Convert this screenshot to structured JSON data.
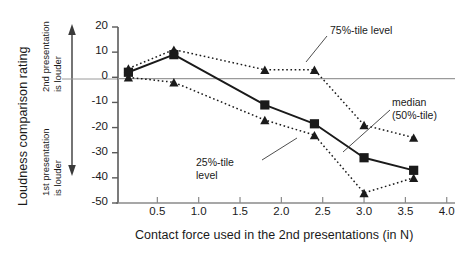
{
  "chart_data": {
    "type": "line",
    "title": "",
    "xlabel": "Contact force used in the 2nd presentations (in N)",
    "ylabel": "Loudness comparison rating",
    "xlim": [
      0.0,
      4.1
    ],
    "ylim": [
      -50,
      20
    ],
    "xticks": [
      "0.5",
      "1.0",
      "1.5",
      "2.0",
      "2.5",
      "3.0",
      "3.5",
      "4.0"
    ],
    "xtick_values": [
      0.5,
      1.0,
      1.5,
      2.0,
      2.5,
      3.0,
      3.5,
      4.0
    ],
    "yticks": [
      "20",
      "10",
      "0",
      "-10",
      "-20",
      "-30",
      "-40",
      "-50"
    ],
    "ytick_values": [
      20,
      10,
      0,
      -10,
      -20,
      -30,
      -40,
      -50
    ],
    "grid": false,
    "legend_position": "inline-annotations",
    "x": [
      0.15,
      0.7,
      1.8,
      2.4,
      3.0,
      3.6
    ],
    "series": [
      {
        "name": "75%-tile level",
        "marker": "triangle",
        "line": "dotted",
        "color": "#1a1a1a",
        "values": [
          3.5,
          11,
          3,
          3,
          -19,
          -24
        ]
      },
      {
        "name": "median (50%-tile)",
        "marker": "square",
        "line": "solid",
        "color": "#1a1a1a",
        "values": [
          2,
          9,
          -11,
          -18.5,
          -32,
          -37
        ]
      },
      {
        "name": "25%-tile level",
        "marker": "triangle",
        "line": "dotted",
        "color": "#1a1a1a",
        "values": [
          0,
          -2,
          -17,
          -23,
          -46,
          -40
        ]
      }
    ],
    "annotations": [
      {
        "id": "upper",
        "text": "75%-tile level",
        "text_lines": [
          "75%-tile level"
        ],
        "label_x": 330,
        "label_y": 24,
        "leader_from": [
          327,
          36
        ],
        "leader_to": [
          306,
          62
        ]
      },
      {
        "id": "median",
        "text": "median (50%-tile)",
        "text_lines": [
          "median",
          "(50%-tile)"
        ],
        "label_x": 392,
        "label_y": 96,
        "leader_from": [
          390,
          110
        ],
        "leader_to": [
          343,
          152
        ]
      },
      {
        "id": "lower",
        "text": "25%-tile level",
        "text_lines": [
          "25%-tile",
          "level"
        ],
        "label_x": 196,
        "label_y": 156,
        "leader_from": [
          262,
          160
        ],
        "leader_to": [
          297,
          138
        ]
      }
    ],
    "axis_direction_labels": {
      "up_line1": "2nd presentation",
      "up_line2": "is louder",
      "down_line1": "1st presentation",
      "down_line2": "is louder"
    }
  }
}
